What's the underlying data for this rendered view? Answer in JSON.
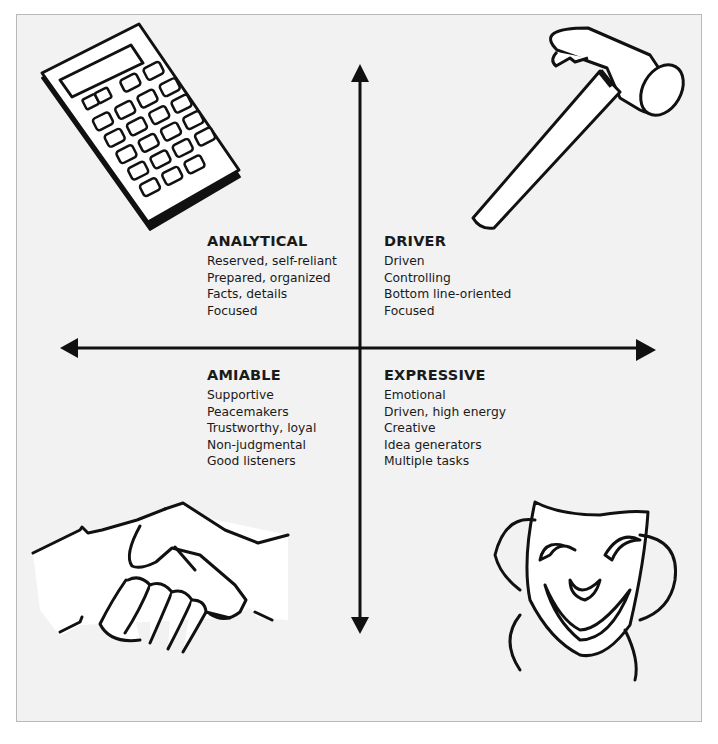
{
  "diagram": {
    "type": "quadrant-chart",
    "axes": {
      "vertical": {
        "arrows": [
          "up",
          "down"
        ]
      },
      "horizontal": {
        "arrows": [
          "left",
          "right"
        ]
      }
    },
    "quadrants": {
      "analytical": {
        "position": "top-left",
        "title": "ANALYTICAL",
        "icon": "calculator-icon",
        "traits": [
          "Reserved, self-reliant",
          "Prepared, organized",
          "Facts, details",
          "Focused"
        ]
      },
      "driver": {
        "position": "top-right",
        "title": "DRIVER",
        "icon": "hammer-icon",
        "traits": [
          "Driven",
          "Controlling",
          "Bottom line-oriented",
          "Focused"
        ]
      },
      "amiable": {
        "position": "bottom-left",
        "title": "AMIABLE",
        "icon": "handshake-icon",
        "traits": [
          "Supportive",
          "Peacemakers",
          "Trustworthy, loyal",
          "Non-judgmental",
          "Good listeners"
        ]
      },
      "expressive": {
        "position": "bottom-right",
        "title": "EXPRESSIVE",
        "icon": "comedy-mask-icon",
        "traits": [
          "Emotional",
          "Driven, high energy",
          "Creative",
          "Idea generators",
          "Multiple tasks"
        ]
      }
    }
  },
  "colors": {
    "background": "#f2f2f2",
    "ink": "#111111",
    "border": "#b8b8b8"
  }
}
